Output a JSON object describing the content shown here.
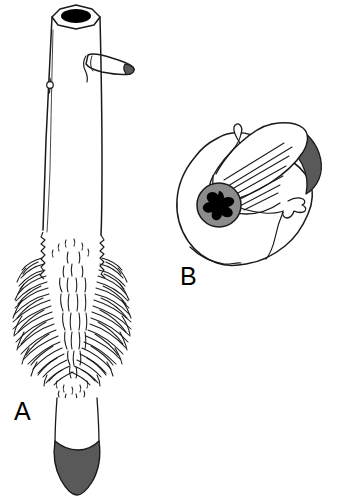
{
  "figure": {
    "background_color": "#ffffff",
    "line_color": "#1a1a1a",
    "fill_white": "#ffffff",
    "fill_dark_gray": "#595959",
    "fill_mid_gray": "#8c8c8c",
    "fill_black": "#000000",
    "panels": [
      {
        "id": "A",
        "label": "A",
        "label_x": 14,
        "label_y": 420,
        "name": "elongate-tubular-organism-whole-view",
        "parts": [
          {
            "name": "apical-aperture",
            "description": "black oval opening at top of tube",
            "color": "#000000"
          },
          {
            "name": "tube-rim",
            "description": "faceted elliptical rim outline at apex",
            "color": "#ffffff"
          },
          {
            "name": "main-tube-body",
            "description": "long tapering cylindrical trunk",
            "color": "#ffffff"
          },
          {
            "name": "lateral-branch",
            "description": "tapering lateral tube projecting right with dark rounded tip",
            "color": "#ffffff",
            "tip_color": "#595959"
          },
          {
            "name": "lateral-pore",
            "description": "small circular pore on left wall of tube",
            "color": "#ffffff"
          },
          {
            "name": "filamentous-fringe",
            "description": "dense plumose bristle mass forming a broad chevron-patterned skirt",
            "color": "#1a1a1a"
          },
          {
            "name": "basal-stalk",
            "description": "narrow white stalk below the fringe",
            "color": "#ffffff"
          },
          {
            "name": "basal-foot",
            "description": "dark gray shield-shaped terminal foot",
            "color": "#595959"
          }
        ]
      },
      {
        "id": "B",
        "label": "B",
        "label_x": 180,
        "label_y": 285,
        "name": "ovoid-cell-detail-view",
        "parts": [
          {
            "name": "cell-outline",
            "description": "rounded ovoid cell body outline",
            "color": "#ffffff"
          },
          {
            "name": "nucleus-ring",
            "description": "gray circular nucleus envelope",
            "color": "#8c8c8c"
          },
          {
            "name": "nucleolus",
            "description": "black four-lobed cross-shaped inclusion inside the nucleus",
            "color": "#000000"
          },
          {
            "name": "elongate-lobe",
            "description": "elongate tapering lobe extending to upper right",
            "color": "#ffffff"
          },
          {
            "name": "dark-crescent-margin",
            "description": "dark gray crescent along the outer margin of the elongate lobe",
            "color": "#595959"
          },
          {
            "name": "striations",
            "description": "parallel diagonal striae radiating from nucleus into the lobe",
            "color": "#1a1a1a"
          },
          {
            "name": "apical-hook",
            "description": "small hooked projection at upper part of lobe",
            "color": "#ffffff"
          },
          {
            "name": "lateral-hook",
            "description": "small hooked appendage on right side of cell",
            "color": "#ffffff"
          }
        ]
      }
    ]
  }
}
